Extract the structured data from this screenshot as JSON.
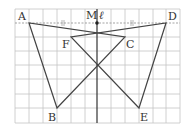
{
  "diagram": {
    "grid": {
      "x0": 15,
      "y0": 9,
      "cell": 14,
      "cols": 12,
      "rows": 8,
      "color": "#b8b8b8"
    },
    "axis_line": {
      "label": "ℓ",
      "x": 97
    },
    "points": {
      "A": {
        "label": "A",
        "x": 29,
        "y": 23
      },
      "D": {
        "label": "D",
        "x": 166,
        "y": 23
      },
      "M": {
        "label": "M",
        "x": 97,
        "y": 23
      },
      "F": {
        "label": "F",
        "x": 71,
        "y": 37
      },
      "C": {
        "label": "C",
        "x": 125,
        "y": 37
      },
      "B": {
        "label": "B",
        "x": 57,
        "y": 108
      },
      "E": {
        "label": "E",
        "x": 139,
        "y": 108
      }
    },
    "segments": [
      "AB",
      "BC",
      "CA",
      "DE",
      "EF",
      "FD"
    ],
    "dashed_segment": "AD",
    "tick_marks": "||",
    "line_color": "#444444"
  }
}
